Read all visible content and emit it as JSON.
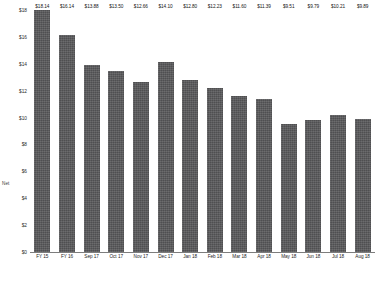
{
  "chart_data": {
    "type": "bar",
    "title": "",
    "subtitle": "",
    "xlabel": "",
    "ylabel": "Net",
    "ylim": [
      0,
      18
    ],
    "grid": false,
    "legend": null,
    "value_prefix": "$",
    "categories": [
      "FY 15",
      "FY 16",
      "Sep 17",
      "Oct 17",
      "Nov 17",
      "Dec 17",
      "Jan 18",
      "Feb 18",
      "Mar 18",
      "Apr 18",
      "May 18",
      "Jun 18",
      "Jul 18",
      "Aug 18"
    ],
    "values": [
      18.14,
      16.14,
      13.88,
      13.5,
      12.66,
      14.1,
      12.8,
      12.23,
      11.6,
      11.39,
      9.51,
      9.79,
      10.21,
      9.89
    ],
    "data_labels": [
      "$18.14",
      "$16.14",
      "$13.88",
      "$13.50",
      "$12.66",
      "$14.10",
      "$12.80",
      "$12.23",
      "$11.60",
      "$11.39",
      "$9.51",
      "$9.79",
      "$10.21",
      "$9.89"
    ],
    "yticks": [
      0,
      2,
      4,
      6,
      8,
      10,
      12,
      14,
      16,
      18
    ],
    "ytick_labels": [
      "$0",
      "$2",
      "$4",
      "$6",
      "$8",
      "$10",
      "$12",
      "$14",
      "$16",
      "$18"
    ],
    "series_color": "#58585a",
    "axis_color": "#7d7d7d"
  }
}
